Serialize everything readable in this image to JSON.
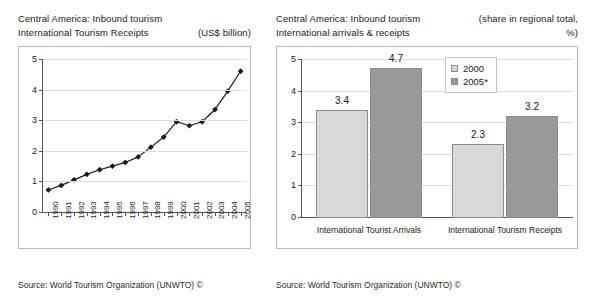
{
  "left_panel": {
    "title_line1": "Central America: Inbound tourism",
    "title_line2": "International Tourism Receipts",
    "unit_note": "(US$ billion)",
    "source": "Source: World Tourism Organization (UNWTO) ©"
  },
  "right_panel": {
    "title_line1": "Central America: Inbound tourism",
    "title_line2": "International arrivals & receipts",
    "unit_note_line1": "(share in regional total,",
    "unit_note_line2": "%)",
    "source": "Source: World Tourism Organization (UNWTO) ©"
  },
  "chart_data": [
    {
      "type": "line",
      "title": "Central America: Inbound tourism — International Tourism Receipts",
      "xlabel": "",
      "ylabel": "",
      "unit": "US$ billion",
      "ylim": [
        0,
        5
      ],
      "yticks": [
        0,
        1,
        2,
        3,
        4,
        5
      ],
      "grid": true,
      "legend": "none",
      "marker": "diamond",
      "categories": [
        "1990",
        "1991",
        "1992",
        "1993",
        "1994",
        "1995",
        "1996",
        "1997",
        "1998",
        "1999",
        "2000",
        "2001",
        "2002",
        "2003",
        "2004",
        "2005"
      ],
      "values": [
        0.72,
        0.87,
        1.05,
        1.23,
        1.38,
        1.5,
        1.62,
        1.8,
        2.12,
        2.45,
        2.95,
        2.82,
        2.95,
        3.35,
        3.95,
        4.6
      ]
    },
    {
      "type": "bar",
      "title": "Central America: Inbound tourism — International arrivals & receipts",
      "xlabel": "",
      "ylabel": "",
      "unit": "share in regional total, %",
      "ylim": [
        0,
        5
      ],
      "yticks": [
        0,
        1,
        2,
        3,
        4,
        5
      ],
      "grid": true,
      "legend": "inside-top-right",
      "categories": [
        "International Tourist Arrivals",
        "International Tourism Receipts"
      ],
      "series": [
        {
          "name": "2000",
          "values": [
            3.4,
            2.3
          ],
          "color": "#d9d9d9"
        },
        {
          "name": "2005*",
          "values": [
            4.7,
            3.2
          ],
          "color": "#9a9a9a"
        }
      ],
      "data_labels": [
        "3.4",
        "4.7",
        "2.3",
        "3.2"
      ]
    }
  ]
}
